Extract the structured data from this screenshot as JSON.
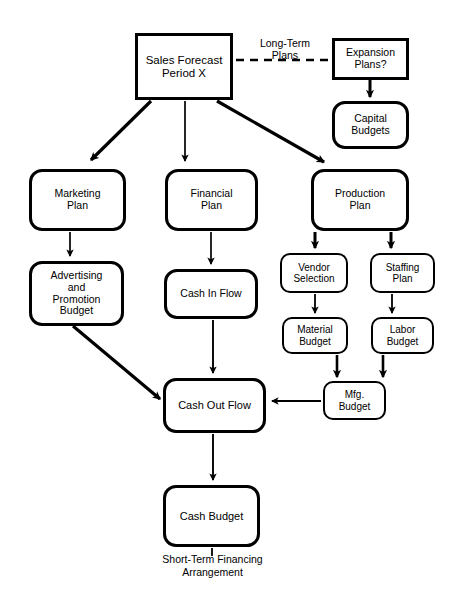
{
  "diagram": {
    "nodes": [
      {
        "id": "sales_forecast",
        "label": "Sales Forecast\nPeriod X",
        "shape": "rect",
        "x": 135,
        "y": 33,
        "w": 98,
        "h": 67,
        "font": 11.5
      },
      {
        "id": "expansion_plans",
        "label": "Expansion\nPlans?",
        "shape": "rect",
        "x": 332,
        "y": 38,
        "w": 77,
        "h": 42,
        "font": 10.5
      },
      {
        "id": "capital_budgets",
        "label": "Capital\nBudgets",
        "shape": "rounded",
        "x": 332,
        "y": 101,
        "w": 77,
        "h": 48,
        "font": 10.5
      },
      {
        "id": "marketing_plan",
        "label": "Marketing\nPlan",
        "shape": "rounded",
        "x": 29,
        "y": 169,
        "w": 97,
        "h": 62,
        "font": 10.5
      },
      {
        "id": "financial_plan",
        "label": "Financial\nPlan",
        "shape": "rounded",
        "x": 165,
        "y": 169,
        "w": 93,
        "h": 62,
        "font": 10.5
      },
      {
        "id": "production_plan",
        "label": "Production\nPlan",
        "shape": "rounded",
        "x": 311,
        "y": 169,
        "w": 98,
        "h": 62,
        "font": 10.5
      },
      {
        "id": "advertising",
        "label": "Advertising\nand\nPromotion\nBudget",
        "shape": "rounded",
        "x": 29,
        "y": 261,
        "w": 95,
        "h": 65,
        "font": 10.5
      },
      {
        "id": "cash_in_flow",
        "label": "Cash In Flow",
        "shape": "rounded",
        "x": 164,
        "y": 269,
        "w": 94,
        "h": 50,
        "font": 10.5
      },
      {
        "id": "vendor_selection",
        "label": "Vendor\nSelection",
        "shape": "rounded",
        "x": 280,
        "y": 253,
        "w": 68,
        "h": 40,
        "font": 10
      },
      {
        "id": "staffing_plan",
        "label": "Staffing\nPlan",
        "shape": "rounded",
        "x": 370,
        "y": 253,
        "w": 65,
        "h": 40,
        "font": 10
      },
      {
        "id": "material_budget",
        "label": "Material\nBudget",
        "shape": "rounded",
        "x": 282,
        "y": 317,
        "w": 66,
        "h": 37,
        "font": 10
      },
      {
        "id": "labor_budget",
        "label": "Labor\nBudget",
        "shape": "rounded",
        "x": 371,
        "y": 317,
        "w": 63,
        "h": 37,
        "font": 10
      },
      {
        "id": "mfg_budget",
        "label": "Mfg.\nBudget",
        "shape": "rounded",
        "x": 323,
        "y": 381,
        "w": 63,
        "h": 39,
        "font": 10
      },
      {
        "id": "cash_out_flow",
        "label": "Cash Out Flow",
        "shape": "rounded",
        "x": 163,
        "y": 378,
        "w": 103,
        "h": 55,
        "font": 11
      },
      {
        "id": "cash_budget",
        "label": "Cash Budget",
        "shape": "rounded",
        "x": 163,
        "y": 485,
        "w": 97,
        "h": 62,
        "font": 11
      }
    ],
    "edge_labels": [
      {
        "id": "long_term_plans",
        "text": "Long-Term\nPlans",
        "x": 243,
        "y": 38,
        "w": 84,
        "font": 10.5
      }
    ],
    "captions": [
      {
        "id": "short_term_financing",
        "text": "Short-Term Financing\nArrangement",
        "x": 130,
        "y": 553,
        "w": 165,
        "font": 10.5
      }
    ],
    "connectors": [
      {
        "id": "sales-to-expansion",
        "kind": "dashed",
        "from": "sales_forecast",
        "to": "expansion_plans"
      },
      {
        "id": "sales-to-marketing",
        "kind": "arrow-thick",
        "from": "sales_forecast",
        "to": "marketing_plan"
      },
      {
        "id": "sales-to-financial",
        "kind": "arrow-thin",
        "from": "sales_forecast",
        "to": "financial_plan"
      },
      {
        "id": "sales-to-production",
        "kind": "arrow-thick",
        "from": "sales_forecast",
        "to": "production_plan"
      },
      {
        "id": "expansion-to-capital",
        "kind": "arrow-thick",
        "from": "expansion_plans",
        "to": "capital_budgets"
      },
      {
        "id": "marketing-to-advertising",
        "kind": "arrow-thin",
        "from": "marketing_plan",
        "to": "advertising"
      },
      {
        "id": "financial-to-cashin",
        "kind": "arrow-thin",
        "from": "financial_plan",
        "to": "cash_in_flow"
      },
      {
        "id": "production-to-vendor",
        "kind": "arrow-thick",
        "from": "production_plan",
        "to": "vendor_selection"
      },
      {
        "id": "production-to-staffing",
        "kind": "arrow-thick",
        "from": "production_plan",
        "to": "staffing_plan"
      },
      {
        "id": "vendor-to-material",
        "kind": "arrow-thin",
        "from": "vendor_selection",
        "to": "material_budget"
      },
      {
        "id": "staffing-to-labor",
        "kind": "arrow-thin",
        "from": "staffing_plan",
        "to": "labor_budget"
      },
      {
        "id": "material-to-mfg",
        "kind": "arrow-thick",
        "from": "material_budget",
        "to": "mfg_budget"
      },
      {
        "id": "labor-to-mfg",
        "kind": "arrow-thick",
        "from": "labor_budget",
        "to": "mfg_budget"
      },
      {
        "id": "mfg-to-cashout",
        "kind": "arrow-thin",
        "from": "mfg_budget",
        "to": "cash_out_flow"
      },
      {
        "id": "advertising-to-cashout",
        "kind": "arrow-thick",
        "from": "advertising",
        "to": "cash_out_flow"
      },
      {
        "id": "cashin-to-cashout",
        "kind": "arrow-thin",
        "from": "cash_in_flow",
        "to": "cash_out_flow"
      },
      {
        "id": "cashout-to-cashbudget",
        "kind": "arrow-thin",
        "from": "cash_out_flow",
        "to": "cash_budget"
      },
      {
        "id": "cashbudget-to-caption",
        "kind": "line",
        "from": "cash_budget",
        "to": "short_term_financing"
      }
    ]
  },
  "colors": {
    "stroke": "#000000",
    "background": "#ffffff",
    "text": "#000000"
  }
}
